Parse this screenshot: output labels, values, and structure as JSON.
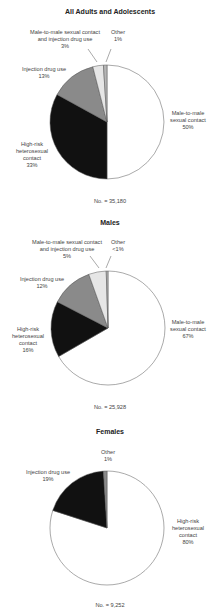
{
  "chart_data": [
    {
      "type": "pie",
      "title": "All Adults and Adolescents",
      "total_label": "No. = 35,180",
      "total": 35180,
      "slices": [
        {
          "label": "Male-to-male sexual contact",
          "value": 50,
          "display": "50%",
          "color": "#ffffff"
        },
        {
          "label": "High-risk heterosexual contact",
          "value": 33,
          "display": "33%",
          "color": "#111111"
        },
        {
          "label": "Injection drug use",
          "value": 13,
          "display": "13%",
          "color": "#8a8a8a"
        },
        {
          "label": "Male-to-male sexual contact and injection drug use",
          "value": 3,
          "display": "3%",
          "color": "#e6e6e6"
        },
        {
          "label": "Other",
          "value": 1,
          "display": "1%",
          "color": "#b5b5b5"
        }
      ]
    },
    {
      "type": "pie",
      "title": "Males",
      "total_label": "No. = 25,928",
      "total": 25928,
      "slices": [
        {
          "label": "Male-to-male sexual contact",
          "value": 67,
          "display": "67%",
          "color": "#ffffff"
        },
        {
          "label": "High-risk heterosexual contact",
          "value": 16,
          "display": "16%",
          "color": "#111111"
        },
        {
          "label": "Injection drug use",
          "value": 12,
          "display": "12%",
          "color": "#8a8a8a"
        },
        {
          "label": "Male-to-male sexual contact and injection drug use",
          "value": 5,
          "display": "5%",
          "color": "#e6e6e6"
        },
        {
          "label": "Other",
          "value": 0.5,
          "display": "<1%",
          "color": "#b5b5b5"
        }
      ]
    },
    {
      "type": "pie",
      "title": "Females",
      "total_label": "No. = 9,252",
      "total": 9252,
      "slices": [
        {
          "label": "High-risk heterosexual contact",
          "value": 80,
          "display": "80%",
          "color": "#ffffff"
        },
        {
          "label": "Injection drug use",
          "value": 19,
          "display": "19%",
          "color": "#111111"
        },
        {
          "label": "Other",
          "value": 1,
          "display": "1%",
          "color": "#8a8a8a"
        }
      ]
    }
  ],
  "charts": [
    {
      "title": "All Adults and Adolescents",
      "total": "No. = 35,180",
      "labels": {
        "msm": [
          "Male-to-male",
          "sexual contact",
          "50%"
        ],
        "het": [
          "High-risk",
          "heterosexual",
          "contact",
          "33%"
        ],
        "idu": [
          "Injection drug use",
          "13%"
        ],
        "msm_idu": [
          "Male-to-male sexual contact",
          "and injection drug use",
          "3%"
        ],
        "other": [
          "Other",
          "1%"
        ]
      }
    },
    {
      "title": "Males",
      "total": "No. = 25,928",
      "labels": {
        "msm": [
          "Male-to-male",
          "sexual contact",
          "67%"
        ],
        "het": [
          "High-risk",
          "heterosexual",
          "contact",
          "16%"
        ],
        "idu": [
          "Injection drug use",
          "12%"
        ],
        "msm_idu": [
          "Male-to-male sexual contact",
          "and injection drug use",
          "5%"
        ],
        "other": [
          "Other",
          "<1%"
        ]
      }
    },
    {
      "title": "Females",
      "total": "No. = 9,252",
      "labels": {
        "het": [
          "High-risk",
          "heterosexual",
          "contact",
          "80%"
        ],
        "idu": [
          "Injection drug use",
          "19%"
        ],
        "other": [
          "Other",
          "1%"
        ]
      }
    }
  ]
}
